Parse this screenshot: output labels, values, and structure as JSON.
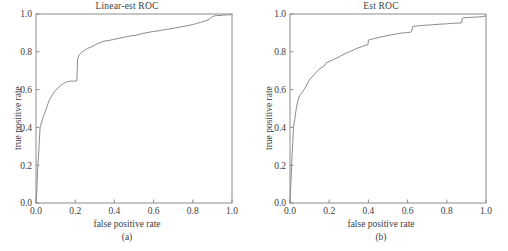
{
  "figure": {
    "background_color": "#ffffff",
    "axis_color": "#8c8c8c",
    "curve_color": "#8a8a8a",
    "text_color": "#3d3d3d"
  },
  "panels": [
    {
      "caption": "(a)",
      "title": "Linear-est ROC",
      "xlabel": "false positive rate",
      "ylabel": "true positive rate"
    },
    {
      "caption": "(b)",
      "title": "Est ROC",
      "xlabel": "false positive rate",
      "ylabel": "true positive rate"
    }
  ],
  "chart_data": [
    {
      "type": "line",
      "title": "Linear-est ROC",
      "subtitle": "(a)",
      "xlabel": "false positive rate",
      "ylabel": "true positive rate",
      "xlim": [
        0.0,
        1.0
      ],
      "ylim": [
        0.0,
        1.0
      ],
      "xticks": [
        0.0,
        0.2,
        0.4,
        0.6,
        0.8,
        1.0
      ],
      "yticks": [
        0.0,
        0.2,
        0.4,
        0.6,
        0.8,
        1.0
      ],
      "xticklabels": [
        "0.0",
        "0.2",
        "0.4",
        "0.6",
        "0.8",
        "1.0"
      ],
      "yticklabels": [
        "0.0",
        "0.2",
        "0.4",
        "0.6",
        "0.8",
        "1.0"
      ],
      "grid": false,
      "legend": "none",
      "series": [
        {
          "name": "Linear-est ROC curve",
          "x": [
            0.0,
            0.004,
            0.006,
            0.008,
            0.01,
            0.012,
            0.014,
            0.016,
            0.018,
            0.02,
            0.022,
            0.026,
            0.03,
            0.034,
            0.038,
            0.044,
            0.05,
            0.056,
            0.062,
            0.068,
            0.074,
            0.08,
            0.086,
            0.092,
            0.1,
            0.108,
            0.116,
            0.124,
            0.132,
            0.14,
            0.15,
            0.16,
            0.17,
            0.18,
            0.19,
            0.2,
            0.208,
            0.21,
            0.212,
            0.218,
            0.226,
            0.234,
            0.244,
            0.254,
            0.264,
            0.276,
            0.29,
            0.3,
            0.312,
            0.326,
            0.34,
            0.356,
            0.372,
            0.39,
            0.408,
            0.426,
            0.444,
            0.462,
            0.48,
            0.5,
            0.52,
            0.54,
            0.56,
            0.58,
            0.6,
            0.62,
            0.64,
            0.66,
            0.68,
            0.7,
            0.72,
            0.74,
            0.76,
            0.78,
            0.8,
            0.82,
            0.84,
            0.86,
            0.878,
            0.89,
            0.9,
            0.912,
            0.926,
            0.94,
            0.956,
            0.972,
            0.986,
            1.0
          ],
          "y": [
            0.0,
            0.06,
            0.12,
            0.175,
            0.205,
            0.235,
            0.27,
            0.31,
            0.345,
            0.385,
            0.405,
            0.418,
            0.432,
            0.446,
            0.458,
            0.474,
            0.492,
            0.51,
            0.528,
            0.545,
            0.556,
            0.566,
            0.576,
            0.586,
            0.596,
            0.604,
            0.612,
            0.62,
            0.626,
            0.632,
            0.638,
            0.642,
            0.644,
            0.645,
            0.645,
            0.645,
            0.646,
            0.7,
            0.76,
            0.778,
            0.79,
            0.798,
            0.806,
            0.812,
            0.818,
            0.824,
            0.83,
            0.836,
            0.842,
            0.848,
            0.854,
            0.858,
            0.86,
            0.864,
            0.868,
            0.872,
            0.876,
            0.88,
            0.884,
            0.886,
            0.89,
            0.896,
            0.9,
            0.904,
            0.908,
            0.91,
            0.914,
            0.918,
            0.92,
            0.924,
            0.928,
            0.932,
            0.936,
            0.94,
            0.944,
            0.95,
            0.956,
            0.962,
            0.968,
            0.978,
            0.986,
            0.99,
            0.992,
            0.992,
            0.994,
            0.995,
            0.996,
            0.997
          ]
        }
      ]
    },
    {
      "type": "line",
      "title": "Est ROC",
      "subtitle": "(b)",
      "xlabel": "false positive rate",
      "ylabel": "true positive rate",
      "xlim": [
        0.0,
        1.0
      ],
      "ylim": [
        0.0,
        1.0
      ],
      "xticks": [
        0.0,
        0.2,
        0.4,
        0.6,
        0.8,
        1.0
      ],
      "yticks": [
        0.0,
        0.2,
        0.4,
        0.6,
        0.8,
        1.0
      ],
      "xticklabels": [
        "0.0",
        "0.2",
        "0.4",
        "0.6",
        "0.8",
        "1.0"
      ],
      "yticklabels": [
        "0.0",
        "0.2",
        "0.4",
        "0.6",
        "0.8",
        "1.0"
      ],
      "grid": false,
      "legend": "none",
      "series": [
        {
          "name": "Est ROC curve",
          "x": [
            0.0,
            0.004,
            0.008,
            0.01,
            0.012,
            0.014,
            0.016,
            0.018,
            0.02,
            0.024,
            0.028,
            0.032,
            0.038,
            0.044,
            0.05,
            0.058,
            0.066,
            0.074,
            0.082,
            0.09,
            0.098,
            0.106,
            0.114,
            0.124,
            0.134,
            0.144,
            0.154,
            0.164,
            0.174,
            0.184,
            0.194,
            0.204,
            0.216,
            0.228,
            0.24,
            0.252,
            0.266,
            0.28,
            0.294,
            0.308,
            0.322,
            0.336,
            0.352,
            0.368,
            0.384,
            0.398,
            0.4,
            0.414,
            0.43,
            0.446,
            0.462,
            0.48,
            0.5,
            0.52,
            0.54,
            0.56,
            0.58,
            0.6,
            0.615,
            0.62,
            0.626,
            0.64,
            0.66,
            0.68,
            0.7,
            0.72,
            0.74,
            0.76,
            0.78,
            0.8,
            0.82,
            0.84,
            0.86,
            0.874,
            0.88,
            0.886,
            0.9,
            0.92,
            0.94,
            0.96,
            0.976,
            0.99,
            1.0
          ],
          "y": [
            0.0,
            0.09,
            0.185,
            0.24,
            0.28,
            0.32,
            0.36,
            0.4,
            0.42,
            0.44,
            0.47,
            0.5,
            0.53,
            0.555,
            0.57,
            0.58,
            0.592,
            0.604,
            0.618,
            0.634,
            0.65,
            0.66,
            0.668,
            0.68,
            0.692,
            0.704,
            0.712,
            0.718,
            0.724,
            0.74,
            0.746,
            0.75,
            0.756,
            0.762,
            0.768,
            0.774,
            0.782,
            0.79,
            0.796,
            0.802,
            0.808,
            0.816,
            0.822,
            0.828,
            0.834,
            0.838,
            0.862,
            0.866,
            0.87,
            0.874,
            0.878,
            0.882,
            0.886,
            0.89,
            0.894,
            0.898,
            0.9,
            0.902,
            0.904,
            0.906,
            0.934,
            0.936,
            0.938,
            0.94,
            0.941,
            0.942,
            0.944,
            0.946,
            0.947,
            0.948,
            0.95,
            0.951,
            0.952,
            0.953,
            0.978,
            0.98,
            0.981,
            0.982,
            0.983,
            0.984,
            0.986,
            0.988,
            0.99
          ]
        }
      ]
    }
  ]
}
